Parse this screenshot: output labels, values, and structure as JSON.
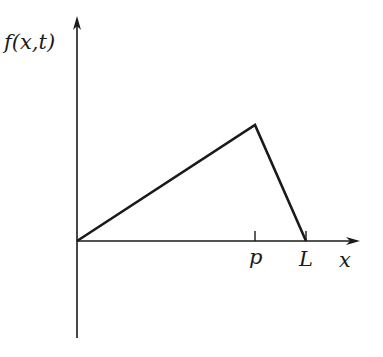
{
  "diagram": {
    "y_axis_label": "f(x,t)",
    "x_axis_label": "x",
    "tick_labels": {
      "p": "p",
      "L": "L"
    },
    "colors": {
      "stroke": "#1a1a1a",
      "background": "#ffffff"
    },
    "shape": "triangle (plucked string) — rises linearly from 0 to peak at x=p, falls linearly to 0 at x=L"
  }
}
